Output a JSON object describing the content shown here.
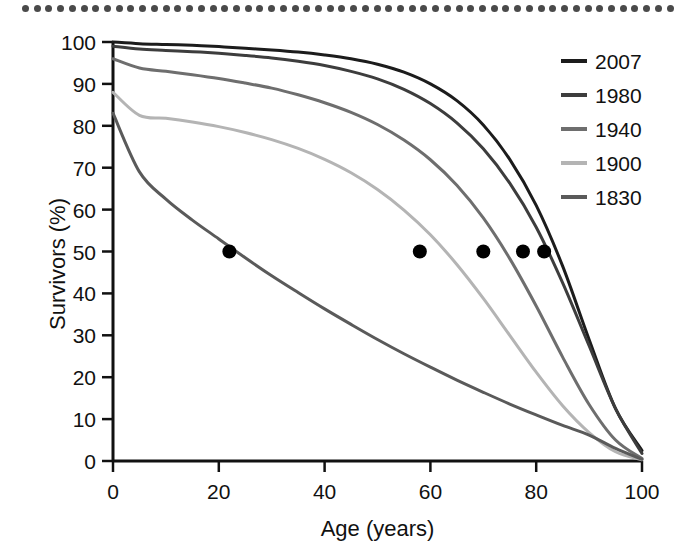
{
  "decor": {
    "top_rule_dot_count": 56,
    "top_rule_color": "#4a4a4a"
  },
  "axes": {
    "x_title": "Age (years)",
    "y_title": "Survivors (%)",
    "x_ticks": [
      "0",
      "20",
      "40",
      "60",
      "80",
      "100"
    ],
    "y_ticks": [
      "0",
      "10",
      "20",
      "30",
      "40",
      "50",
      "60",
      "70",
      "80",
      "90",
      "100"
    ]
  },
  "legend": {
    "items": [
      {
        "label": "2007",
        "color": "#1c1c1c"
      },
      {
        "label": "1980",
        "color": "#3d3d3d"
      },
      {
        "label": "1940",
        "color": "#6e6e6e"
      },
      {
        "label": "1900",
        "color": "#b4b4b4"
      },
      {
        "label": "1830",
        "color": "#5a5a5a"
      }
    ]
  },
  "chart_data": {
    "type": "line",
    "title": "",
    "xlabel": "Age (years)",
    "ylabel": "Survivors (%)",
    "xlim": [
      0,
      100
    ],
    "ylim": [
      0,
      100
    ],
    "xticks": [
      0,
      20,
      40,
      60,
      80,
      100
    ],
    "yticks": [
      0,
      10,
      20,
      30,
      40,
      50,
      60,
      70,
      80,
      90,
      100
    ],
    "grid": false,
    "legend_position": "right",
    "x": [
      0,
      5,
      10,
      15,
      20,
      25,
      30,
      35,
      40,
      45,
      50,
      55,
      60,
      65,
      70,
      75,
      80,
      85,
      90,
      95,
      100
    ],
    "series": [
      {
        "name": "2007",
        "color": "#1c1c1c",
        "values": [
          100,
          99.6,
          99.4,
          99.2,
          98.9,
          98.5,
          98.1,
          97.6,
          96.9,
          96.0,
          94.7,
          92.8,
          90.0,
          86.0,
          80.2,
          72.0,
          61.0,
          46.5,
          29.0,
          12.5,
          2.5
        ],
        "median_age": 81.5
      },
      {
        "name": "1980",
        "color": "#3d3d3d",
        "values": [
          99.0,
          98.3,
          98.0,
          97.7,
          97.3,
          96.8,
          96.2,
          95.4,
          94.4,
          93.0,
          91.2,
          88.7,
          85.3,
          80.7,
          74.5,
          66.3,
          55.8,
          42.5,
          27.5,
          12.5,
          1.8
        ],
        "median_age": 77.5
      },
      {
        "name": "1940",
        "color": "#6e6e6e",
        "values": [
          96.0,
          93.8,
          93.0,
          92.2,
          91.3,
          90.2,
          89.0,
          87.4,
          85.5,
          83.2,
          80.3,
          76.6,
          71.9,
          65.8,
          58.0,
          48.3,
          37.0,
          24.8,
          13.5,
          5.0,
          0.6
        ],
        "median_age": 70.0
      },
      {
        "name": "1900",
        "color": "#b4b4b4",
        "values": [
          88.0,
          82.5,
          81.8,
          80.9,
          79.8,
          78.4,
          76.7,
          74.6,
          72.0,
          68.8,
          64.8,
          59.9,
          54.0,
          46.9,
          38.8,
          30.0,
          21.2,
          13.2,
          6.8,
          2.2,
          0.3
        ],
        "median_age": 58.0
      },
      {
        "name": "1830",
        "color": "#5a5a5a",
        "values": [
          83.0,
          69.0,
          62.5,
          57.5,
          53.0,
          48.5,
          44.2,
          40.2,
          36.3,
          32.6,
          29.0,
          25.6,
          22.4,
          19.3,
          16.4,
          13.6,
          11.0,
          8.5,
          6.2,
          3.0,
          0.4
        ],
        "median_age": 22.0
      }
    ],
    "median_markers": {
      "note": "filled black dots marking the age at which 50% of the cohort survives",
      "survivors_percent": 50,
      "ages": [
        22.0,
        58.0,
        70.0,
        77.5,
        81.5
      ],
      "color": "#000000"
    }
  }
}
